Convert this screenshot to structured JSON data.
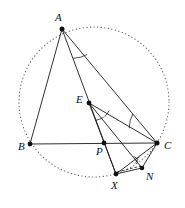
{
  "figure": {
    "kind": "euclidean-geometry-diagram",
    "canvas": {
      "width": 185,
      "height": 208,
      "background": "#ffffff"
    },
    "stroke_color": "#1a1a1a",
    "circle_color": "#6f6f6f",
    "vertex_color": "#111111"
  },
  "points": [
    {
      "id": "A",
      "label": "A",
      "x": 62,
      "y": 29,
      "label_x": 55,
      "label_y": 12,
      "dot": true
    },
    {
      "id": "B",
      "label": "B",
      "x": 30,
      "y": 144,
      "label_x": 18,
      "label_y": 141,
      "dot": true
    },
    {
      "id": "C",
      "label": "C",
      "x": 157,
      "y": 143,
      "label_x": 164,
      "label_y": 140,
      "dot": true
    },
    {
      "id": "E",
      "label": "E",
      "x": 89,
      "y": 103,
      "label_x": 76,
      "label_y": 94,
      "dot": true
    },
    {
      "id": "P",
      "label": "P",
      "x": 104,
      "y": 143,
      "label_x": 96,
      "label_y": 146,
      "dot": true
    },
    {
      "id": "X",
      "label": "X",
      "x": 116,
      "y": 174,
      "label_x": 111,
      "label_y": 180,
      "dot": true
    },
    {
      "id": "N",
      "label": "N",
      "x": 142,
      "y": 168,
      "label_x": 146,
      "label_y": 171,
      "dot": true
    }
  ],
  "circumcircle": {
    "center_x": 94,
    "center_y": 102,
    "radius": 75,
    "style": "dotted",
    "passes_through": [
      "A",
      "B",
      "C",
      "X"
    ]
  },
  "segments": [
    {
      "id": "AB",
      "from": "A",
      "to": "B",
      "style": "solid"
    },
    {
      "id": "BC",
      "from": "B",
      "to": "C",
      "style": "solid"
    },
    {
      "id": "AC",
      "from": "A",
      "to": "C",
      "style": "solid"
    },
    {
      "id": "AX",
      "from": "A",
      "to": "X",
      "style": "solid"
    },
    {
      "id": "EC",
      "from": "E",
      "to": "C",
      "style": "solid"
    },
    {
      "id": "EX",
      "from": "E",
      "to": "X",
      "style": "solid"
    },
    {
      "id": "EN",
      "from": "E",
      "to": "N",
      "style": "solid"
    },
    {
      "id": "CX",
      "from": "C",
      "to": "X",
      "style": "solid"
    },
    {
      "id": "CN",
      "from": "C",
      "to": "N",
      "style": "solid"
    },
    {
      "id": "XN",
      "from": "X",
      "to": "N",
      "style": "solid"
    },
    {
      "id": "XN-dashed",
      "from": "X",
      "to": "N",
      "style": "dashed"
    }
  ],
  "angle_marks": [
    {
      "id": "angle-at-A",
      "vertex": "A",
      "type": "arc",
      "note": "arc between ray A-X and ray A-C"
    },
    {
      "id": "angle-at-E-1",
      "vertex": "E",
      "type": "arc",
      "note": "arc between ray E-X and ray E-N"
    },
    {
      "id": "angle-at-E-2",
      "vertex": "E",
      "type": "arc",
      "note": "arc between ray E-N and ray E-C"
    },
    {
      "id": "angle-at-C",
      "vertex": "C",
      "type": "arc",
      "note": "arc between ray C-A and ray C-E"
    },
    {
      "id": "right-angle-at-N",
      "vertex": "N",
      "type": "square",
      "note": "right angle between C-N and X-N"
    }
  ],
  "labels": {
    "A": "A",
    "B": "B",
    "C": "C",
    "E": "E",
    "P": "P",
    "X": "X",
    "N": "N"
  }
}
